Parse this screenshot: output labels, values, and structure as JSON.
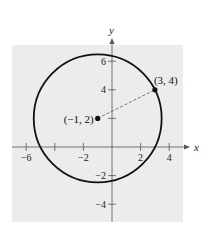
{
  "chart_data": {
    "type": "scatter",
    "title": "",
    "xlabel": "x",
    "ylabel": "y",
    "xlim": [
      -6.9,
      5.1
    ],
    "ylim": [
      -5.2,
      7.0
    ],
    "grid": false,
    "background": "#ececec",
    "x_ticks": [
      -6,
      -4,
      -2,
      2,
      4
    ],
    "x_tick_labels": [
      "-6",
      "",
      "-2",
      "2",
      "4"
    ],
    "y_ticks": [
      -4,
      -2,
      2,
      4,
      6
    ],
    "y_tick_labels": [
      "−4",
      "−2",
      "",
      "4",
      "6"
    ],
    "circle": {
      "center": [
        -1,
        2
      ],
      "radius": 4.472,
      "equation": "(x+1)^2 + (y-2)^2 = 20",
      "color": "#111111"
    },
    "points": [
      {
        "x": -1,
        "y": 2,
        "label": "(−1, 2)"
      },
      {
        "x": 3,
        "y": 4,
        "label": "(3, 4)"
      }
    ],
    "segments": [
      {
        "from": [
          -1,
          2
        ],
        "to": [
          3,
          4
        ],
        "style": "dashed"
      }
    ]
  }
}
